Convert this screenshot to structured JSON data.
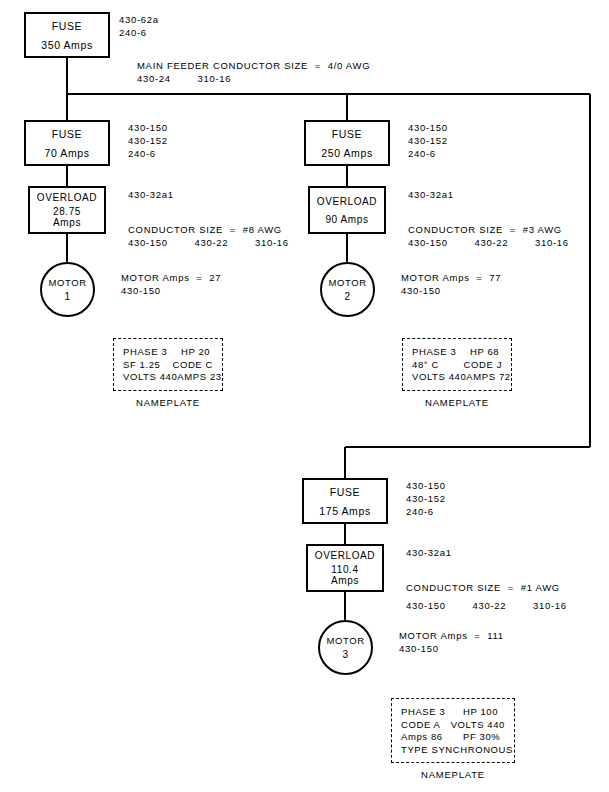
{
  "diagram": {
    "line_color": "#000000",
    "background": "#ffffff"
  },
  "main": {
    "fuse": {
      "label": "FUSE",
      "rating": "350 Amps"
    },
    "fuse_codes": {
      "line1": "430-62a",
      "line2": "240-6"
    },
    "feeder_note": {
      "line1": "MAIN FEEDER CONDUCTOR SIZE  =  4/0 AWG",
      "line2": "430-24        310-16"
    }
  },
  "branches": [
    {
      "id": "branch-1",
      "fuse": {
        "label": "FUSE",
        "rating": "70 Amps"
      },
      "fuse_codes": {
        "line1": "430-150",
        "line2": "430-152",
        "line3": "240-6"
      },
      "overload": {
        "label": "OVERLOAD",
        "value": "28.75",
        "unit": "Amps"
      },
      "overload_code": "430-32a1",
      "conductor": {
        "line1": "CONDUCTOR SIZE  =  #8 AWG",
        "line2": "430-150        430-22        310-16"
      },
      "motor": {
        "label": "MOTOR",
        "number": "1"
      },
      "motor_note": {
        "line1": "MOTOR Amps  =  27",
        "line2": "430-150"
      },
      "nameplate": {
        "caption": "NAMEPLATE",
        "rows": [
          {
            "left": "PHASE 3",
            "right": "HP 20"
          },
          {
            "left": "SF 1.25",
            "right": "CODE C"
          },
          {
            "left": "VOLTS 440",
            "right": "AMPS 23"
          }
        ]
      }
    },
    {
      "id": "branch-2",
      "fuse": {
        "label": "FUSE",
        "rating": "250 Amps"
      },
      "fuse_codes": {
        "line1": "430-150",
        "line2": "430-152",
        "line3": "240-6"
      },
      "overload": {
        "label": "OVERLOAD",
        "value": "90 Amps",
        "unit": ""
      },
      "overload_code": "430-32a1",
      "conductor": {
        "line1": "CONDUCTOR SIZE  =  #3 AWG",
        "line2": "430-150        430-22        310-16"
      },
      "motor": {
        "label": "MOTOR",
        "number": "2"
      },
      "motor_note": {
        "line1": "MOTOR Amps  =  77",
        "line2": "430-150"
      },
      "nameplate": {
        "caption": "NAMEPLATE",
        "rows": [
          {
            "left": "PHASE 3",
            "right": "HP 68"
          },
          {
            "left": "48° C",
            "right": "CODE J"
          },
          {
            "left": "VOLTS 440",
            "right": "AMPS 72"
          }
        ]
      }
    },
    {
      "id": "branch-3",
      "fuse": {
        "label": "FUSE",
        "rating": "175 Amps"
      },
      "fuse_codes": {
        "line1": "430-150",
        "line2": "430-152",
        "line3": "240-6"
      },
      "overload": {
        "label": "OVERLOAD",
        "value": "110.4",
        "unit": "Amps"
      },
      "overload_code": "430-32a1",
      "conductor": {
        "line1": "CONDUCTOR SIZE  =  #1 AWG",
        "line2": "430-150        430-22        310-16"
      },
      "motor": {
        "label": "MOTOR",
        "number": "3"
      },
      "motor_note": {
        "line1": "MOTOR Amps  =  111",
        "line2": "430-150"
      },
      "nameplate": {
        "caption": "NAMEPLATE",
        "rows": [
          {
            "left": "PHASE 3",
            "right": "HP 100"
          },
          {
            "left": "CODE A",
            "right": "VOLTS 440"
          },
          {
            "left": "Amps 86",
            "right": "PF 30%"
          }
        ],
        "full_row": "TYPE SYNCHRONOUS"
      }
    }
  ]
}
